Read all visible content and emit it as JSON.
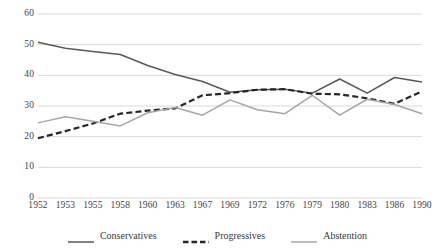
{
  "chart_data": {
    "type": "line",
    "title": "",
    "subtitle": "",
    "xlabel": "",
    "ylabel": "",
    "grid": true,
    "legend_position": "bottom",
    "ylim": [
      0,
      60
    ],
    "yticks": [
      0,
      10,
      20,
      30,
      40,
      50,
      60
    ],
    "categories": [
      "1952",
      "1953",
      "1955",
      "1958",
      "1960",
      "1963",
      "1967",
      "1969",
      "1972",
      "1976",
      "1979",
      "1980",
      "1983",
      "1986",
      "1990"
    ],
    "series": [
      {
        "name": "Conservatives",
        "color": "#595959",
        "style": "solid",
        "values": [
          50.8,
          48.8,
          47.8,
          46.8,
          43.2,
          40.3,
          38.0,
          34.5,
          35.3,
          35.5,
          34.2,
          38.8,
          34.2,
          39.3,
          37.8
        ]
      },
      {
        "name": "Progressives",
        "color": "#262626",
        "style": "dashed",
        "values": [
          19.5,
          21.8,
          24.3,
          27.5,
          28.5,
          29.2,
          33.5,
          34.2,
          35.3,
          35.5,
          34.0,
          33.8,
          32.5,
          30.7,
          34.8
        ]
      },
      {
        "name": "Abstention",
        "color": "#a6a6a6",
        "style": "solid",
        "values": [
          24.5,
          26.5,
          25.0,
          23.5,
          27.8,
          29.5,
          27.0,
          32.0,
          28.8,
          27.5,
          33.5,
          27.0,
          32.2,
          30.5,
          27.5
        ]
      }
    ]
  },
  "legend": {
    "items": [
      {
        "label": "Conservatives",
        "icon": "line-solid-dark-icon"
      },
      {
        "label": "Progressives",
        "icon": "line-dashed-dark-icon"
      },
      {
        "label": "Abstention",
        "icon": "line-solid-gray-icon"
      }
    ]
  },
  "axes": {
    "y_tick_labels": [
      "60",
      "50",
      "40",
      "30",
      "20",
      "10",
      "0"
    ],
    "x_tick_labels": [
      "1952",
      "1953",
      "1955",
      "1958",
      "1960",
      "1963",
      "1967",
      "1969",
      "1972",
      "1976",
      "1979",
      "1980",
      "1983",
      "1986",
      "1990"
    ]
  }
}
